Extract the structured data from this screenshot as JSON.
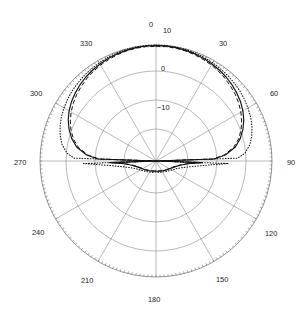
{
  "figure": {
    "kind": "polar-radiation-pattern",
    "background_color": "#ffffff",
    "center_x": 156,
    "center_y": 161,
    "outer_radius": 116
  },
  "chart_data": {
    "type": "line",
    "subtype": "polar",
    "title": "",
    "xlabel": "",
    "ylabel": "",
    "grid": true,
    "legend": "none",
    "angle_unit": "degrees",
    "angle_direction": "clockwise",
    "angle_zero_at": "top",
    "angular_tick_labels": [
      "0",
      "30",
      "60",
      "90",
      "120",
      "150",
      "180",
      "210",
      "240",
      "270",
      "300",
      "330"
    ],
    "angular_tick_values": [
      0,
      30,
      60,
      90,
      120,
      150,
      180,
      210,
      240,
      270,
      300,
      330
    ],
    "angular_tick_step": 30,
    "radial_tick_labels": [
      "10",
      "0",
      "-10"
    ],
    "radial_tick_values": [
      10,
      0,
      -10
    ],
    "radial_unit": "dB",
    "rlim": [
      -30,
      10
    ],
    "ring_radii_px": [
      32,
      61,
      90,
      116
    ],
    "ring_values": [
      -20,
      -10,
      0,
      10
    ],
    "series": [
      {
        "name": "solid",
        "style": "solid",
        "color": "#111111",
        "theta": [
          0,
          5,
          10,
          15,
          20,
          25,
          30,
          35,
          40,
          45,
          50,
          55,
          60,
          65,
          70,
          75,
          80,
          85,
          88,
          90,
          92,
          95,
          100,
          105,
          110,
          120,
          130,
          140,
          150,
          160,
          170,
          180,
          190,
          200,
          210,
          220,
          230,
          240,
          250,
          255,
          260,
          265,
          268,
          270,
          272,
          275,
          280,
          285,
          290,
          295,
          300,
          305,
          310,
          315,
          320,
          325,
          330,
          335,
          340,
          345,
          350,
          355,
          360
        ],
        "r_db": [
          9.8,
          9.8,
          9.7,
          9.5,
          9.3,
          9.0,
          8.6,
          8.2,
          7.7,
          7.1,
          6.4,
          5.6,
          4.6,
          3.4,
          1.9,
          0.1,
          -2.2,
          -6.0,
          -10.0,
          -30.0,
          -14.0,
          -19.0,
          -21.5,
          -22.8,
          -23.6,
          -24.6,
          -25.2,
          -25.7,
          -26.0,
          -26.3,
          -26.4,
          -26.5,
          -26.4,
          -26.3,
          -26.0,
          -25.7,
          -25.2,
          -24.6,
          -23.6,
          -22.8,
          -21.5,
          -19.0,
          -14.0,
          -30.0,
          -10.0,
          -6.0,
          -2.2,
          0.1,
          1.9,
          3.4,
          4.6,
          5.6,
          6.4,
          7.1,
          7.7,
          8.2,
          8.6,
          9.0,
          9.3,
          9.5,
          9.7,
          9.8,
          9.8
        ]
      },
      {
        "name": "dashed",
        "style": "dashed",
        "color": "#111111",
        "theta": [
          0,
          5,
          10,
          15,
          20,
          25,
          30,
          35,
          40,
          45,
          50,
          55,
          60,
          65,
          70,
          75,
          80,
          85,
          88,
          90,
          92,
          95,
          100,
          105,
          110,
          120,
          130,
          140,
          150,
          160,
          170,
          180,
          190,
          200,
          210,
          220,
          230,
          240,
          250,
          255,
          260,
          265,
          268,
          270,
          272,
          275,
          280,
          285,
          290,
          295,
          300,
          305,
          310,
          315,
          320,
          325,
          330,
          335,
          340,
          345,
          350,
          355,
          360
        ],
        "r_db": [
          9.6,
          9.6,
          9.5,
          9.3,
          9.0,
          8.6,
          8.2,
          7.7,
          7.1,
          6.4,
          5.7,
          4.8,
          3.8,
          2.6,
          1.2,
          -0.5,
          -2.8,
          -6.4,
          -10.4,
          -30.0,
          -14.4,
          -19.4,
          -21.8,
          -23.0,
          -23.8,
          -24.8,
          -25.4,
          -25.9,
          -26.2,
          -26.4,
          -26.5,
          -26.6,
          -26.5,
          -26.4,
          -26.2,
          -25.9,
          -25.4,
          -24.8,
          -23.8,
          -23.0,
          -21.8,
          -19.4,
          -14.4,
          -30.0,
          -10.4,
          -6.4,
          -2.8,
          -0.5,
          1.2,
          2.6,
          3.8,
          4.8,
          5.7,
          6.4,
          7.1,
          7.7,
          8.2,
          8.6,
          9.0,
          9.3,
          9.5,
          9.6,
          9.6
        ]
      },
      {
        "name": "dotted",
        "style": "dotted",
        "color": "#111111",
        "theta": [
          0,
          5,
          10,
          15,
          20,
          25,
          30,
          35,
          40,
          45,
          50,
          55,
          60,
          65,
          70,
          75,
          80,
          85,
          88,
          90,
          92,
          95,
          100,
          105,
          110,
          120,
          130,
          140,
          150,
          160,
          170,
          180,
          190,
          200,
          210,
          220,
          230,
          240,
          250,
          255,
          260,
          265,
          268,
          270,
          272,
          275,
          280,
          285,
          290,
          295,
          300,
          305,
          310,
          315,
          320,
          325,
          330,
          335,
          340,
          345,
          350,
          355,
          360
        ],
        "r_db": [
          10.0,
          10.0,
          9.9,
          9.8,
          9.6,
          9.4,
          9.1,
          8.8,
          8.5,
          8.1,
          7.7,
          7.2,
          6.6,
          6.0,
          5.2,
          4.2,
          2.9,
          0.8,
          -1.8,
          -30.0,
          -5.0,
          -13.0,
          -18.5,
          -21.0,
          -22.4,
          -23.8,
          -24.6,
          -25.2,
          -25.6,
          -25.9,
          -26.1,
          -26.2,
          -26.1,
          -25.9,
          -25.6,
          -25.2,
          -24.6,
          -23.8,
          -22.4,
          -21.0,
          -18.5,
          -13.0,
          -5.0,
          -30.0,
          -1.8,
          0.8,
          2.9,
          4.2,
          5.2,
          6.0,
          6.6,
          7.2,
          7.7,
          8.1,
          8.5,
          8.8,
          9.1,
          9.4,
          9.6,
          9.8,
          9.9,
          10.0,
          10.0
        ]
      }
    ]
  },
  "labels": {
    "angular": [
      {
        "text": "0",
        "x": 149,
        "y": 27
      },
      {
        "text": "30",
        "x": 219,
        "y": 46
      },
      {
        "text": "60",
        "x": 270,
        "y": 96
      },
      {
        "text": "90",
        "x": 287,
        "y": 165
      },
      {
        "text": "120",
        "x": 265,
        "y": 236
      },
      {
        "text": "150",
        "x": 216,
        "y": 282
      },
      {
        "text": "180",
        "x": 148,
        "y": 302
      },
      {
        "text": "210",
        "x": 81,
        "y": 283
      },
      {
        "text": "240",
        "x": 32,
        "y": 235
      },
      {
        "text": "270",
        "x": 14,
        "y": 165
      },
      {
        "text": "300",
        "x": 30,
        "y": 96
      },
      {
        "text": "330",
        "x": 80,
        "y": 46
      }
    ],
    "radial": [
      {
        "text": "10",
        "x": 163,
        "y": 33
      },
      {
        "text": "0",
        "x": 161,
        "y": 71
      },
      {
        "text": "-10",
        "x": 157,
        "y": 110
      }
    ]
  }
}
